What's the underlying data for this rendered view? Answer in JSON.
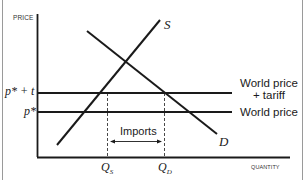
{
  "diagram": {
    "axes": {
      "y_label": "PRICE",
      "x_label": "QUANTITY"
    },
    "curves": {
      "supply_label": "S",
      "demand_label": "D"
    },
    "price_levels": {
      "tariff_price_label": "p* + t",
      "world_price_label": "p*",
      "tariff_line_caption_1": "World price",
      "tariff_line_caption_2": "+ tariff",
      "world_line_caption": "World price"
    },
    "quantities": {
      "qs_label": "Q",
      "qs_sub": "S",
      "qd_label": "Q",
      "qd_sub": "D"
    },
    "imports_label": "Imports",
    "colors": {
      "line": "#1a1a1a",
      "frame": "#9a9a9a",
      "background": "#ffffff"
    }
  }
}
